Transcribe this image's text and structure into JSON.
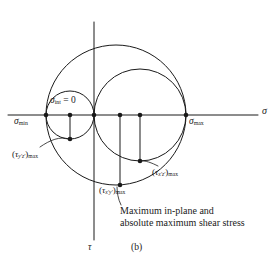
{
  "figure": {
    "figure_ref": "(b)",
    "background_color": "#ffffff",
    "line_color": "#1a1a1a",
    "axes": {
      "horizontal_label": "σ",
      "vertical_label": "τ",
      "origin_x": 94,
      "origin_y": 115
    },
    "points": {
      "sigma_min": {
        "label_base": "σ",
        "label_sub": "min",
        "x": 46,
        "y": 115
      },
      "sigma_int": {
        "label_base": "σ",
        "label_sub": "int",
        "label_value": " = 0",
        "x": 94,
        "y": 115
      },
      "sigma_max": {
        "label_base": "σ",
        "label_sub": "max",
        "x": 186,
        "y": 115
      },
      "tau_yz_center": {
        "x": 70,
        "y": 115
      },
      "tau_xy_center": {
        "x": 120,
        "y": 115
      },
      "tau_xz_center": {
        "x": 140,
        "y": 115
      },
      "tau_yz_bottom": {
        "x": 70,
        "y": 139
      },
      "tau_xy_bottom": {
        "x": 120,
        "y": 185
      },
      "tau_xz_bottom": {
        "x": 140,
        "y": 161
      }
    },
    "circles": [
      {
        "name": "small-circle-yz",
        "center_x": 70,
        "center_y": 115,
        "radius": 24,
        "spans": "sigma_min to sigma_int"
      },
      {
        "name": "medium-circle-xy",
        "center_x": 140,
        "center_y": 115,
        "radius": 46,
        "spans": "sigma_int to sigma_max"
      },
      {
        "name": "large-circle-xz",
        "center_x": 116,
        "center_y": 115,
        "radius": 70,
        "spans": "sigma_min to sigma_max"
      }
    ],
    "shear_labels": {
      "tau_yz": {
        "open": "(",
        "base": "τ",
        "sub_prime": "y′z′",
        "close": ")",
        "sub_max": "max"
      },
      "tau_xy": {
        "open": "(",
        "base": "τ",
        "sub_prime": "x′y′",
        "close": ")",
        "sub_max": "max"
      },
      "tau_xz": {
        "open": "(",
        "base": "τ",
        "sub_prime": "x′z′",
        "close": ")",
        "sub_max": "max"
      }
    },
    "caption": {
      "line1": "Maximum in-plane and",
      "line2": "absolute maximum shear stress"
    }
  }
}
